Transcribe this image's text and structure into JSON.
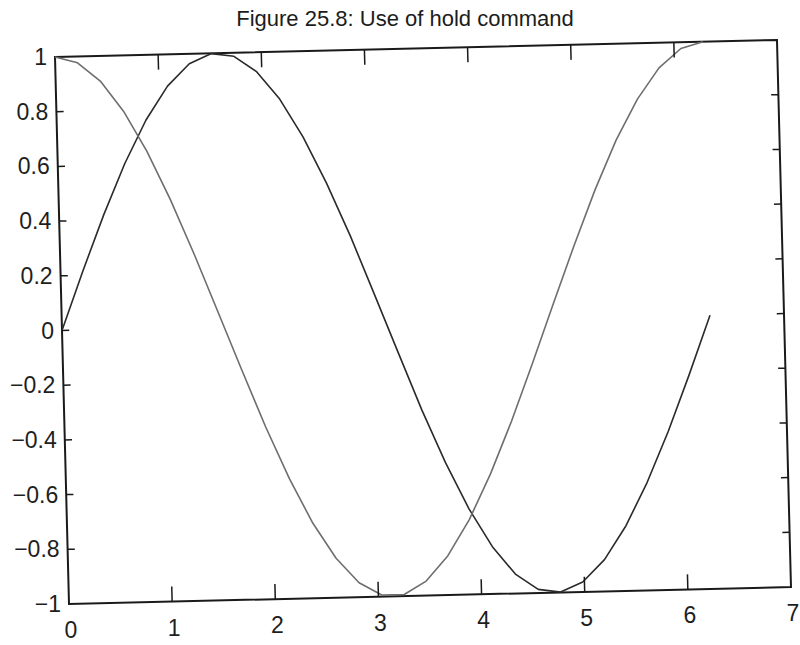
{
  "title": "Figure 25.8: Use of hold command",
  "chart_data": {
    "type": "line",
    "title": "Figure 25.8: Use of hold command",
    "xlabel": "",
    "ylabel": "",
    "xlim": [
      0,
      7
    ],
    "ylim": [
      -1,
      1
    ],
    "grid": false,
    "legend": null,
    "xticks": [
      0,
      1,
      2,
      3,
      4,
      5,
      6,
      7
    ],
    "xtick_labels": [
      "0",
      "1",
      "2",
      "3",
      "4",
      "5",
      "6",
      "7"
    ],
    "yticks": [
      -1,
      -0.8,
      -0.6,
      -0.4,
      -0.2,
      0,
      0.2,
      0.4,
      0.6,
      0.8,
      1
    ],
    "ytick_labels": [
      "−1",
      "−0.8",
      "−0.6",
      "−0.4",
      "−0.2",
      "0",
      "0.2",
      "0.4",
      "0.6",
      "0.8",
      "1"
    ],
    "series": [
      {
        "name": "sin(x)",
        "color": "#2a2a2a",
        "x_range": [
          0,
          6.2832
        ],
        "num_points": 30,
        "x": [
          0,
          0.2167,
          0.4333,
          0.65,
          0.8666,
          1.0833,
          1.3,
          1.5166,
          1.7333,
          1.95,
          2.1666,
          2.3833,
          2.5999,
          2.8166,
          3.0333,
          3.2499,
          3.4666,
          3.6832,
          3.8999,
          4.1166,
          4.3332,
          4.5499,
          4.7666,
          4.9832,
          5.1999,
          5.4165,
          5.6332,
          5.8499,
          6.0665,
          6.2832
        ],
        "y": [
          0,
          0.215,
          0.42,
          0.605,
          0.762,
          0.884,
          0.964,
          0.999,
          0.987,
          0.929,
          0.827,
          0.687,
          0.516,
          0.321,
          0.108,
          -0.108,
          -0.321,
          -0.516,
          -0.687,
          -0.827,
          -0.929,
          -0.987,
          -0.999,
          -0.964,
          -0.884,
          -0.762,
          -0.605,
          -0.42,
          -0.215,
          0
        ]
      },
      {
        "name": "cos(x)",
        "color": "#6e6e6e",
        "x_range": [
          0,
          6.2832
        ],
        "num_points": 30,
        "x": [
          0,
          0.2167,
          0.4333,
          0.65,
          0.8666,
          1.0833,
          1.3,
          1.5166,
          1.7333,
          1.95,
          2.1666,
          2.3833,
          2.5999,
          2.8166,
          3.0333,
          3.2499,
          3.4666,
          3.6832,
          3.8999,
          4.1166,
          4.3332,
          4.5499,
          4.7666,
          4.9832,
          5.1999,
          5.4165,
          5.6332,
          5.8499,
          6.0665,
          6.2832
        ],
        "y": [
          1,
          0.977,
          0.908,
          0.796,
          0.648,
          0.468,
          0.267,
          0.054,
          -0.161,
          -0.37,
          -0.561,
          -0.726,
          -0.856,
          -0.947,
          -0.994,
          -0.994,
          -0.947,
          -0.856,
          -0.726,
          -0.561,
          -0.37,
          -0.161,
          0.054,
          0.267,
          0.468,
          0.648,
          0.796,
          0.908,
          0.977,
          1
        ]
      }
    ]
  }
}
